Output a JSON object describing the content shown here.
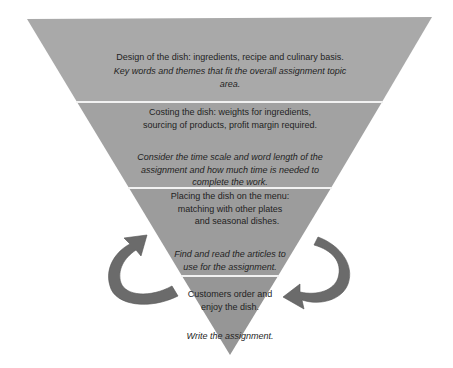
{
  "diagram": {
    "type": "inverted-pyramid",
    "colors": {
      "band_1": "#a9a9a9",
      "band_2": "#a2a2a2",
      "band_3": "#9c9c9c",
      "band_4": "#969696",
      "divider": "#f2f2f2",
      "arrow": "#6b6b6b",
      "text": "#1f1f1f"
    },
    "levels": [
      {
        "heading": "Design of the dish: ingredients, recipe and culinary basis.",
        "italic_lines": [
          "Key words and themes that fit the overall assignment topic",
          "area."
        ]
      },
      {
        "heading_lines": [
          "Costing the dish: weights for ingredients,",
          "sourcing of products, profit margin required."
        ],
        "italic_lines": [
          "Consider the time scale and word length of the",
          "assignment and how much time is needed to",
          "complete the work."
        ]
      },
      {
        "heading_lines": [
          "Placing the dish on the menu:",
          "matching with other plates",
          "and seasonal dishes."
        ],
        "italic_lines": [
          "Find and read the articles to",
          "use for the assignment."
        ]
      },
      {
        "heading_lines": [
          "Customers order and",
          "enjoy the dish."
        ],
        "italic_lines": [
          "Write the assignment."
        ]
      }
    ],
    "arrows": [
      {
        "side": "left",
        "direction": "up-right"
      },
      {
        "side": "right",
        "direction": "down-left"
      }
    ]
  }
}
